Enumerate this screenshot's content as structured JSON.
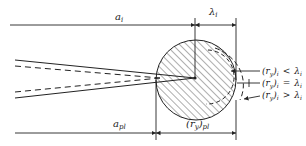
{
  "diagram": {
    "type": "crack-tip plastic zone schematic",
    "colors": {
      "ink": "#222222",
      "background": "#ffffff"
    },
    "labels": {
      "a_i": "a",
      "a_i_sub": "i",
      "lambda_i": "λ",
      "lambda_i_sub": "i",
      "a_pl": "a",
      "a_pl_sub": "pl",
      "ry_pl": "(r",
      "ry_pl_sub1": "y",
      "ry_pl_close": ")",
      "ry_pl_sub2": "pl"
    },
    "conditions": [
      {
        "lhs": "(r",
        "sub1": "y",
        "close": ")",
        "sub2": "i",
        "op": "<",
        "rhs": "λ",
        "rhs_sub": "i"
      },
      {
        "lhs": "(r",
        "sub1": "y",
        "close": ")",
        "sub2": "i",
        "op": "=",
        "rhs": "λ",
        "rhs_sub": "i"
      },
      {
        "lhs": "(r",
        "sub1": "y",
        "close": ")",
        "sub2": "i",
        "op": ">",
        "rhs": "λ",
        "rhs_sub": "i"
      }
    ]
  }
}
